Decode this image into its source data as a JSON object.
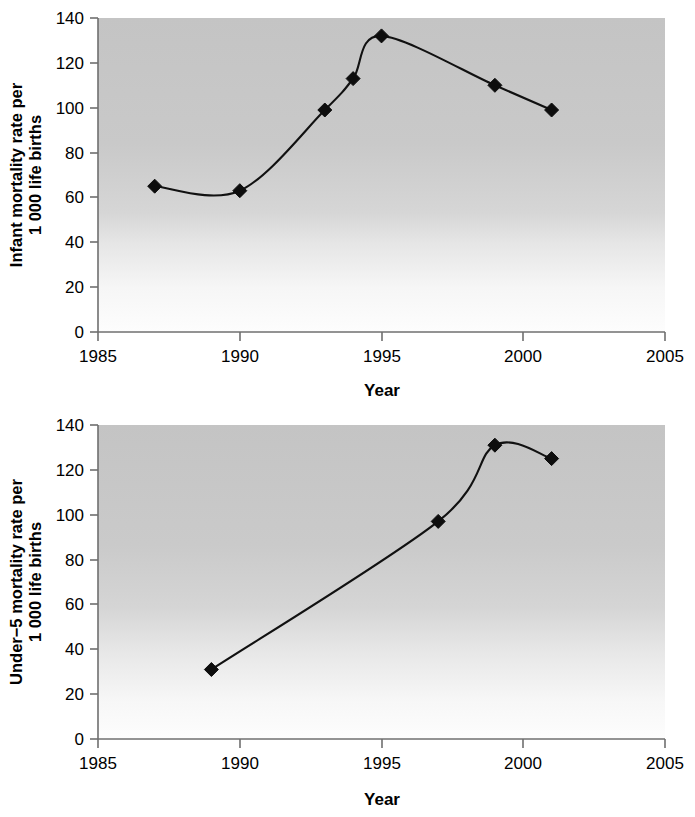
{
  "chart_data": [
    {
      "id": "infant-mortality",
      "type": "line",
      "title": "",
      "xlabel": "Year",
      "ylabel_line1": "Infant mortality rate per",
      "ylabel_line2": "1 000 life births",
      "ylabel": "Infant mortality rate per 1 000 life births",
      "xlim": [
        1985,
        2005
      ],
      "ylim": [
        0,
        140
      ],
      "xticks": [
        1985,
        1990,
        1995,
        2000,
        2005
      ],
      "xtick_labels": [
        "1985",
        "1990",
        "1995",
        "2000",
        "2005"
      ],
      "yticks": [
        0,
        20,
        40,
        60,
        80,
        100,
        120,
        140
      ],
      "ytick_labels": [
        "0",
        "20",
        "40",
        "60",
        "80",
        "100",
        "120",
        "140"
      ],
      "grid": false,
      "legend": "none",
      "marker": "diamond",
      "line_color": "#111111",
      "marker_color": "#0d0d0d",
      "panel_fill": "#c8c8c8",
      "x": [
        1987,
        1990,
        1993,
        1994,
        1995,
        1999,
        2001
      ],
      "values": [
        65,
        63,
        99,
        113,
        132,
        110,
        99
      ]
    },
    {
      "id": "under5-mortality",
      "type": "line",
      "title": "",
      "xlabel": "Year",
      "ylabel_line1": "Under−5 mortality rate per",
      "ylabel_line2": "1 000 life births",
      "ylabel": "Under−5 mortality rate per 1 000 life births",
      "xlim": [
        1985,
        2005
      ],
      "ylim": [
        0,
        140
      ],
      "xticks": [
        1985,
        1990,
        1995,
        2000,
        2005
      ],
      "xtick_labels": [
        "1985",
        "1990",
        "1995",
        "2000",
        "2005"
      ],
      "yticks": [
        0,
        20,
        40,
        60,
        80,
        100,
        120,
        140
      ],
      "ytick_labels": [
        "0",
        "20",
        "40",
        "60",
        "80",
        "100",
        "120",
        "140"
      ],
      "grid": false,
      "legend": "none",
      "marker": "diamond",
      "line_color": "#111111",
      "marker_color": "#0d0d0d",
      "panel_fill": "#c8c8c8",
      "x": [
        1989,
        1997,
        1999,
        2001
      ],
      "values": [
        31,
        97,
        131,
        125
      ]
    }
  ],
  "figures": {
    "infant": {
      "ylabel_line1": "Infant mortality rate per",
      "ylabel_line2": "1 000 life births",
      "xlabel": "Year",
      "ytick_labels": [
        "140",
        "120",
        "100",
        "80",
        "60",
        "40",
        "20",
        "0"
      ],
      "xtick_labels": [
        "1985",
        "1990",
        "1995",
        "2000",
        "2005"
      ]
    },
    "under5": {
      "ylabel_line1": "Under−5 mortality rate per",
      "ylabel_line2": "1 000 life births",
      "xlabel": "Year",
      "ytick_labels": [
        "140",
        "120",
        "100",
        "80",
        "60",
        "40",
        "20",
        "0"
      ],
      "xtick_labels": [
        "1985",
        "1990",
        "1995",
        "2000",
        "2005"
      ]
    }
  }
}
